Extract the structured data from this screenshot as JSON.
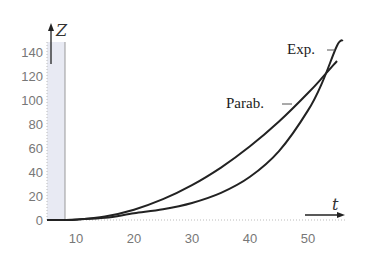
{
  "chart_data": {
    "type": "line",
    "title": "",
    "xlabel": "t",
    "ylabel": "Z",
    "xlim": [
      5,
      56
    ],
    "ylim": [
      0,
      150
    ],
    "x_ticks": [
      10,
      20,
      30,
      40,
      50
    ],
    "y_ticks": [
      0,
      20,
      40,
      60,
      80,
      100,
      120,
      140
    ],
    "grid": false,
    "shaded_band": {
      "x_from": 5,
      "x_to": 8.5,
      "color": "#e6e8f2"
    },
    "legend": "inline labels",
    "series": [
      {
        "name": "Parab.",
        "x": [
          8,
          10,
          15,
          20,
          25,
          30,
          35,
          40,
          45,
          50,
          52.5,
          55
        ],
        "values": [
          0,
          0.2,
          2.9,
          8.6,
          17.3,
          29.0,
          43.7,
          61.4,
          82.1,
          105.8,
          118.8,
          132.5
        ]
      },
      {
        "name": "Exp.",
        "x": [
          8,
          10,
          15,
          20,
          25,
          30,
          35,
          40,
          45,
          50,
          52.5,
          55,
          56
        ],
        "values": [
          0,
          0.5,
          1.8,
          5.6,
          8.9,
          14.2,
          22.6,
          36.0,
          57.4,
          91.3,
          115.1,
          145.2,
          150
        ]
      }
    ]
  },
  "labels": {
    "y_axis": "Z",
    "x_axis": "t",
    "parab": "Parab.",
    "exp": "Exp.",
    "y_ticks": [
      "140",
      "120",
      "100",
      "80",
      "60",
      "40",
      "20",
      "0"
    ],
    "x_ticks": [
      "10",
      "20",
      "30",
      "40",
      "50"
    ]
  }
}
